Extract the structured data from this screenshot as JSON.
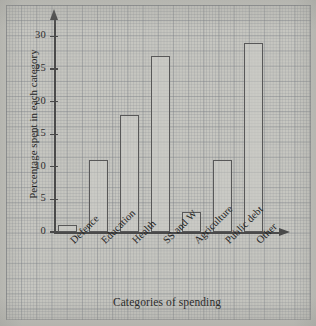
{
  "chart_data": {
    "type": "bar",
    "title": "",
    "xlabel": "Categories of spending",
    "ylabel": "Percentage spent in each category",
    "categories": [
      "Defence",
      "Education",
      "Health",
      "SS and W",
      "Agriculture",
      "Public debt",
      "Other"
    ],
    "values": [
      1,
      11,
      18,
      27,
      3,
      11,
      29
    ],
    "ylim": [
      0,
      32
    ],
    "yticks": [
      0,
      5,
      10,
      15,
      20,
      25,
      30
    ],
    "ytick_labels": [
      "0",
      "5",
      "10",
      "15",
      "20",
      "25",
      "30"
    ],
    "grid": true,
    "legend": false,
    "bar_edge_color": "#585858",
    "bar_fill_color": "#cecec8",
    "axis_color": "#4a4a4a",
    "background_color": "#c6c6c0"
  }
}
